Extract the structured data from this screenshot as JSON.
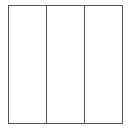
{
  "diagram": {
    "type": "three-panel layout",
    "columns": [
      {
        "label": ""
      },
      {
        "label": ""
      },
      {
        "label": ""
      }
    ],
    "stroke_color": "#555555",
    "fill_color": "#ffffff"
  }
}
